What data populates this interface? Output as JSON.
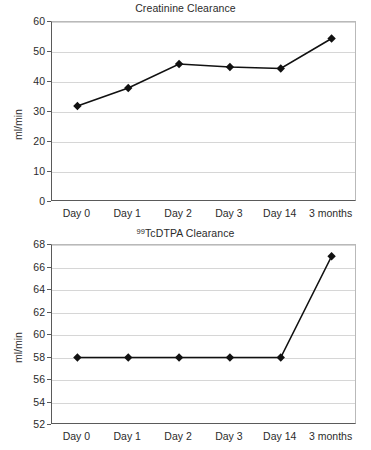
{
  "charts": [
    {
      "title_prefix": "",
      "title_sup": "",
      "title_main": "Creatinine Clearance",
      "ylabel": "ml/min"
    },
    {
      "title_prefix": "",
      "title_sup": "99",
      "title_main": "TcDTPA Clearance",
      "ylabel": "ml/min"
    }
  ],
  "chart_data": [
    {
      "type": "line",
      "title": "Creatinine Clearance",
      "xlabel": "",
      "ylabel": "ml/min",
      "categories": [
        "Day 0",
        "Day 1",
        "Day 2",
        "Day 3",
        "Day 14",
        "3 months"
      ],
      "values": [
        32,
        38,
        46,
        45,
        44.5,
        54.5
      ],
      "ylim": [
        0,
        60
      ],
      "ytick_step": 10,
      "yticks": [
        0,
        10,
        20,
        30,
        40,
        50,
        60
      ],
      "grid": true,
      "legend": "none",
      "marker": "diamond",
      "line_color": "#111111",
      "marker_color": "#111111"
    },
    {
      "type": "line",
      "title": "99TcDTPA Clearance",
      "xlabel": "",
      "ylabel": "ml/min",
      "categories": [
        "Day 0",
        "Day 1",
        "Day 2",
        "Day 3",
        "Day 14",
        "3 months"
      ],
      "values": [
        58,
        58,
        58,
        58,
        58,
        67
      ],
      "ylim": [
        52,
        68
      ],
      "ytick_step": 2,
      "yticks": [
        52,
        54,
        56,
        58,
        60,
        62,
        64,
        66,
        68
      ],
      "grid": true,
      "legend": "none",
      "marker": "diamond",
      "line_color": "#111111",
      "marker_color": "#111111"
    }
  ]
}
